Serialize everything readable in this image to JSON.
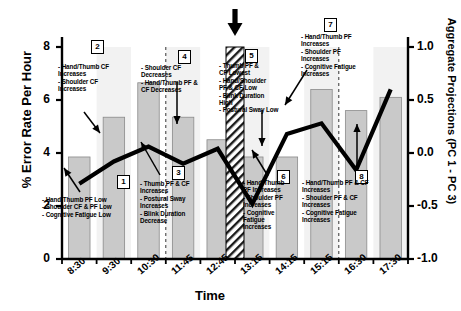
{
  "chart_data": {
    "type": "bar",
    "title": "",
    "xlabel": "Time",
    "ylabel": "% Error Rate Per Hour",
    "y2label": "Aggregate Projections\n(PC 1 - PC 3)",
    "categories": [
      "8:30",
      "9:30",
      "10:30",
      "11:45",
      "12:45",
      "13:15",
      "14:15",
      "15:15",
      "16:30",
      "17:30"
    ],
    "grid": false,
    "legend": "none",
    "ylim": [
      0,
      8
    ],
    "yticks": [
      "0",
      "2",
      "4",
      "6",
      "8"
    ],
    "y2lim": [
      -1.0,
      1.0
    ],
    "y2ticks": [
      "-1.0",
      "-0.5",
      "0.0",
      "0.5",
      "1.0"
    ],
    "series": [
      {
        "name": "% Error Rate Per Hour",
        "type": "bar",
        "axis": "left",
        "color": "#c9c9c9",
        "values": [
          3.85,
          5.35,
          6.65,
          5.35,
          4.5,
          3.85,
          3.85,
          6.4,
          5.6,
          6.1
        ]
      },
      {
        "name": "Aggregate Projections (PC 1 - PC 3)",
        "type": "line",
        "axis": "right",
        "color": "#000000",
        "values": [
          -0.29,
          -0.08,
          0.06,
          -0.1,
          0.04,
          -0.48,
          0.18,
          0.28,
          -0.16,
          0.6
        ]
      }
    ],
    "break_band": {
      "label": "break",
      "start_category": "12:45",
      "end_category": "13:15",
      "style": "hatched",
      "marker": "down-arrow"
    },
    "vertical_dashed_lines": [
      "10:30",
      "15:15"
    ],
    "annotations": [
      {
        "id": "1",
        "box": "1",
        "text": "- Hand/Thumb PF Low\n- Shoulder CF & PF Low\n- Cognitive Fatigue Low",
        "points_to": "8:30"
      },
      {
        "id": "2",
        "box": "2",
        "text": "- Hand/Thumb CF\nIncreases\n- Shoulder CF\nIncreases",
        "points_to": "9:30"
      },
      {
        "id": "3",
        "box": "3",
        "text": "- Thumb PF & CF\nIncreases\n- Postural Sway\nIncreases\n- Blink Duration\nDecrease",
        "points_to": "10:30"
      },
      {
        "id": "4",
        "box": "4",
        "text": "- Shoulder CF\nDecreases\n- Hand/Thumb PF &\nCF Decreases",
        "points_to": "11:45"
      },
      {
        "id": "5",
        "box": "5",
        "text": "- Thumb PF &\nCF Lowest\n- Hand/Shoulder\nPF & CF Low\n- Blink Duration\nHigh\n- Postural Sway Low",
        "points_to": "13:15"
      },
      {
        "id": "6",
        "box": "6",
        "text": "- Hand/Thumb\nPF Increases\n- Shoulder PF\nIncreases\n- Cognitive\nFatigue\nIncreases",
        "points_to": "14:15"
      },
      {
        "id": "7",
        "box": "7",
        "text": "- Hand/Thumb PF\nIncreases\n- Shoulder PF\nIncreases\n- Cognitive Fatigue\nIncreases",
        "points_to": "15:15"
      },
      {
        "id": "8",
        "box": "8",
        "text": "- Hand/Thumb PF & CF\nIncreases\n- Shoulder PF & CF\nIncreases\n- Cognitive Fatigue\nIncreases",
        "points_to": "17:30"
      }
    ]
  },
  "axes": {
    "left_label": "% Error Rate Per Hour",
    "right_label": "Aggregate Projections\n(PC 1 - PC 3)",
    "x_label": "Time"
  }
}
